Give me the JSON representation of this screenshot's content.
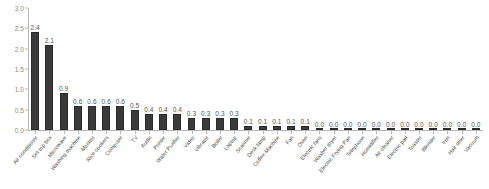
{
  "chart_data": {
    "type": "bar",
    "title": "",
    "subtitle": "",
    "xlabel": "",
    "ylabel": "",
    "ylim": [
      0.0,
      3.0
    ],
    "ytick_labels": [
      "0.0",
      "0.5",
      "1.0",
      "1.5",
      "2.0",
      "2.5",
      "3.0"
    ],
    "ytick_values": [
      0.0,
      0.5,
      1.0,
      1.5,
      2.0,
      2.5,
      3.0
    ],
    "grid": false,
    "legend": false,
    "legend_position": "none",
    "bar_color": "#3a3a3a",
    "axis_color": "#b9b9b9",
    "label_color": "#545454",
    "categories": [
      "Air conditioner",
      "Set top box",
      "Microwave",
      "Washing machine",
      "Monitor",
      "Rice cookers",
      "Computer",
      "TV",
      "Audio",
      "Printer",
      "Water Purifier",
      "Video",
      "Vibrator",
      "Boiler",
      "Laptop",
      "Scanner",
      "Desk lamp",
      "Coffee Machine",
      "Fan",
      "Oven",
      "Electric fans",
      "Washer dryer",
      "Electric Frying Pan",
      "Telephone",
      "Humidifier",
      "Air cleaner",
      "Electric pad",
      "Toaster",
      "Blender",
      "Iron",
      "Hair drier",
      "Vacuum"
    ],
    "values": [
      2.4,
      2.1,
      0.9,
      0.6,
      0.6,
      0.6,
      0.6,
      0.5,
      0.4,
      0.4,
      0.4,
      0.3,
      0.3,
      0.3,
      0.3,
      0.1,
      0.1,
      0.1,
      0.1,
      0.1,
      0.0,
      0.0,
      0.0,
      0.0,
      0.0,
      0.0,
      0.0,
      0.0,
      0.0,
      0.0,
      0.0,
      0.0
    ],
    "value_labels": [
      "2.4",
      "2.1",
      "0.9",
      "0.6",
      "0.6",
      "0.6",
      "0.6",
      "0.5",
      "0.4",
      "0.4",
      "0.4",
      "0.3",
      "0.3",
      "0.3",
      "0.3",
      "0.1",
      "0.1",
      "0.1",
      "0.1",
      "0.1",
      "0.0",
      "0.0",
      "0.0",
      "0.0",
      "0.0",
      "0.0",
      "0.0",
      "0.0",
      "0.0",
      "0.0",
      "0.0",
      "0.0"
    ]
  }
}
